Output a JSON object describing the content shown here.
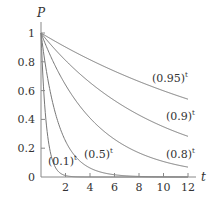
{
  "chart_data": {
    "type": "line",
    "title": "",
    "xlabel": "t",
    "ylabel": "P",
    "xlim": [
      0,
      12
    ],
    "ylim": [
      0,
      1
    ],
    "x_ticks": [
      "2",
      "4",
      "6",
      "8",
      "10",
      "12"
    ],
    "y_ticks": [
      "0",
      "0.2",
      "0.4",
      "0.6",
      "0.8",
      "1"
    ],
    "grid": false,
    "legend": "none (inline labels)",
    "series": [
      {
        "name": "(0.95)^t",
        "base": 0.95,
        "label": "(0.95)",
        "sup": "t"
      },
      {
        "name": "(0.9)^t",
        "base": 0.9,
        "label": "(0.9)",
        "sup": "t"
      },
      {
        "name": "(0.8)^t",
        "base": 0.8,
        "label": "(0.8)",
        "sup": "t"
      },
      {
        "name": "(0.5)^t",
        "base": 0.5,
        "label": "(0.5)",
        "sup": "t"
      },
      {
        "name": "(0.1)^t",
        "base": 0.1,
        "label": "(0.1)",
        "sup": "t"
      }
    ],
    "line_color": "#777777"
  }
}
